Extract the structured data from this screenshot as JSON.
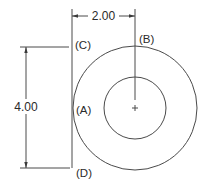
{
  "diagram": {
    "type": "technical-drawing",
    "colors": {
      "line": "#4a4a4a",
      "text": "#2a2a2a",
      "background": "#ffffff"
    },
    "dimensions": {
      "horizontal": {
        "label": "2.00"
      },
      "vertical": {
        "label": "4.00"
      }
    },
    "points": {
      "A": {
        "label": "(A)"
      },
      "B": {
        "label": "(B)"
      },
      "C": {
        "label": "(C)"
      },
      "D": {
        "label": "(D)"
      }
    },
    "center_mark": {
      "label": "+"
    },
    "shapes": {
      "outer_circle": {
        "cx": 135,
        "cy": 108,
        "r": 62
      },
      "inner_circle": {
        "cx": 135,
        "cy": 108,
        "r": 31
      }
    }
  }
}
